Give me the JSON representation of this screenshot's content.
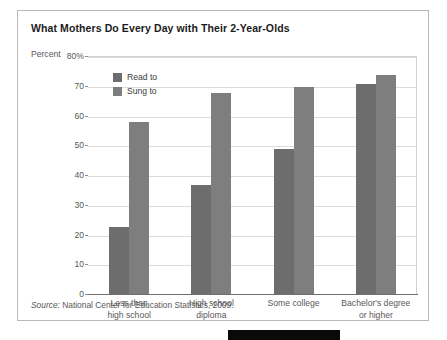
{
  "figure": {
    "title": "What Mothers Do Every Day with Their 2-Year-Olds",
    "axis_caption": "Percent",
    "source_label": "Source:",
    "source_text": " National Center for Education Statistics, 2009."
  },
  "colors": {
    "read_to": "#6d6d6d",
    "sung_to": "#7e7e7e",
    "gridline": "#dcdcdc",
    "axis": "#6f6f6f",
    "card_border": "#b9b9b9",
    "title_text": "#1b1b1b",
    "label_text": "#585858",
    "marker": "#0a0a0a"
  },
  "chart_data": {
    "type": "bar",
    "title": "What Mothers Do Every Day with Their 2-Year-Olds",
    "xlabel": "",
    "ylabel": "Percent",
    "ylim": [
      0,
      80
    ],
    "yticks": [
      0,
      10,
      20,
      30,
      40,
      50,
      60,
      70,
      80
    ],
    "ytick_labels": [
      "0",
      "10",
      "20",
      "30",
      "40",
      "50",
      "60",
      "70",
      "80%"
    ],
    "grid": true,
    "legend_position": "inside-top-left",
    "categories": [
      "Less than high school",
      "High school diploma",
      "Some college",
      "Bachelor's degree or higher"
    ],
    "category_lines": [
      [
        "Less than",
        "high school"
      ],
      [
        "High school",
        "diploma"
      ],
      [
        "Some college",
        ""
      ],
      [
        "Bachelor's degree",
        "or higher"
      ]
    ],
    "series": [
      {
        "name": "Read to",
        "values": [
          23,
          37,
          49,
          71
        ]
      },
      {
        "name": "Sung to",
        "values": [
          58,
          68,
          70,
          74
        ]
      }
    ],
    "source": "Source: National Center for Education Statistics, 2009."
  }
}
